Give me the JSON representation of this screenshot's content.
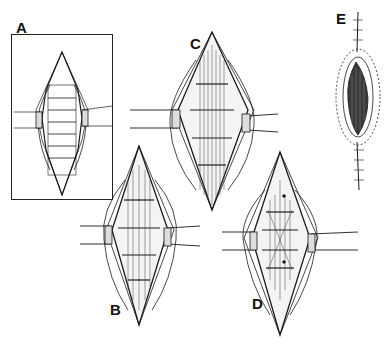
{
  "figure": {
    "type": "surgical-illustration",
    "style": "pen-and-ink line drawing",
    "colors": {
      "ink": "#1a1a1a",
      "background": "#ffffff",
      "shade": "#555555"
    },
    "panels": [
      {
        "id": "A",
        "label": "A",
        "description": "Inset: diamond-shaped incision with retracted edges and transverse layers",
        "boxed": true
      },
      {
        "id": "B",
        "label": "B",
        "description": "Diamond incision with retractors, exposed vertical fibers and transverse bands"
      },
      {
        "id": "C",
        "label": "C",
        "description": "Diamond incision with retractors, exposed vertical fibers and transverse bands"
      },
      {
        "id": "D",
        "label": "D",
        "description": "Diamond incision with retractors, crossing strands and two marked points"
      },
      {
        "id": "E",
        "label": "E",
        "description": "Closed incision with sutures along midline, dark central region"
      }
    ]
  }
}
